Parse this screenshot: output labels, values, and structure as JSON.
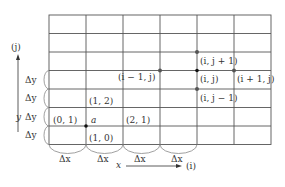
{
  "grid": {
    "cols": 6,
    "rows": 7,
    "x_lines": [
      49,
      86,
      123,
      160,
      197,
      234,
      271
    ],
    "y_lines": [
      15,
      33.5,
      52,
      70.5,
      89,
      107.5,
      126,
      144.5
    ]
  },
  "labels": {
    "j_axis": "(j)",
    "i_axis": "(i)",
    "x_var": "x",
    "y_var": "y",
    "delta_y": "Δy",
    "delta_x": "Δx",
    "node_0_1": "(0, 1)",
    "node_1_0": "(1, 0)",
    "node_1_2": "(1, 2)",
    "node_2_1": "(2, 1)",
    "node_a": "a",
    "node_im1_j": "(i − 1, j)",
    "node_i_jp1": "(i, j + 1)",
    "node_i_j": "(i, j)",
    "node_ip1_j": "(i + 1, j)",
    "node_i_jm1": "(i, j − 1)"
  }
}
